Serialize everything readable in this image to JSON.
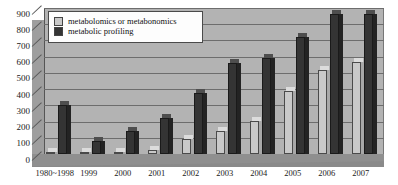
{
  "chart_data": {
    "type": "bar",
    "title": "",
    "xlabel": "",
    "ylabel": "",
    "ylim": [
      0,
      900
    ],
    "ytick_step": 100,
    "yticks": [
      0,
      100,
      200,
      300,
      400,
      500,
      600,
      700,
      800,
      900
    ],
    "grid": true,
    "legend_position": "top-left",
    "three_d": true,
    "categories": [
      "1980~1998",
      "1999",
      "2000",
      "2001",
      "2002",
      "2003",
      "2004",
      "2005",
      "2006",
      "2007"
    ],
    "series": [
      {
        "name": "metabolomics or metabonomics",
        "color": "#c9c9c9",
        "values": [
          10,
          15,
          15,
          25,
          90,
          140,
          205,
          390,
          520,
          570
        ]
      },
      {
        "name": "metabolic profiling",
        "color": "#343434",
        "values": [
          305,
          80,
          140,
          225,
          375,
          560,
          590,
          720,
          865,
          865
        ]
      }
    ]
  },
  "legend": {
    "items": [
      {
        "label": "metabolomics or metabonomics",
        "swatch": "light-gray-swatch-icon"
      },
      {
        "label": "metabolic profiling",
        "swatch": "dark-gray-swatch-icon"
      }
    ]
  },
  "axis": {
    "y_tick_labels": [
      "900",
      "800",
      "700",
      "600",
      "500",
      "400",
      "300",
      "200",
      "100",
      "0"
    ],
    "x_tick_labels": [
      "1980~1998",
      "1999",
      "2000",
      "2001",
      "2002",
      "2003",
      "2004",
      "2005",
      "2006",
      "2007"
    ]
  }
}
